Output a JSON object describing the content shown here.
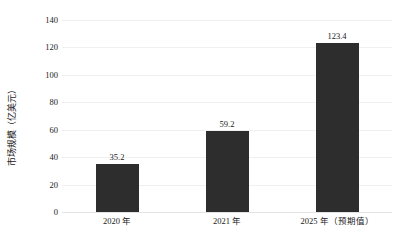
{
  "chart_data": {
    "type": "bar",
    "title": "",
    "xlabel": "",
    "ylabel": "市场规模（亿美元）",
    "categories": [
      "2020 年",
      "2021 年",
      "2025 年（预期值）"
    ],
    "values": [
      35.2,
      59.2,
      123.4
    ],
    "value_labels": [
      "35.2",
      "59.2",
      "123.4"
    ],
    "ylim": [
      0,
      140
    ],
    "yticks": [
      0,
      20,
      40,
      60,
      80,
      100,
      120,
      140
    ],
    "ytick_labels": [
      "0",
      "20",
      "40",
      "60",
      "80",
      "100",
      "120",
      "140"
    ],
    "grid": true,
    "legend": "none",
    "bar_color": "#2d2d2d",
    "gridline_color": "#f0f0f0",
    "background_color": "#ffffff",
    "text_color": "#1a1a1a"
  }
}
